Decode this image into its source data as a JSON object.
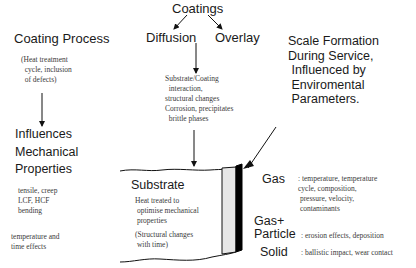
{
  "diagram": {
    "top": {
      "coatings": "Coatings",
      "diffusion": "Diffusion",
      "overlay": "Overlay"
    },
    "left": {
      "coating_process": "Coating Process",
      "coating_process_note": "(Heat treatment\n  cycle, inclusion\n  of defects)",
      "influences_line1": "Influences",
      "influences_line2": "Mechanical",
      "influences_line3": "Properties",
      "mech_note": " tensile, creep\n LCF, HCF\n bending",
      "temp_note": "temperature and\ntime effects"
    },
    "center": {
      "interaction_note": "Substrate/Coating\n  interaction,\nstructural changes\nCorrosion, precipitates\n  brittle phases",
      "substrate_title": "Substrate",
      "substrate_note1": "Heat treated to\n optimise mechanical\n properties",
      "substrate_note2": "(Structural changes\n with time)"
    },
    "right": {
      "scale_title": "Scale Formation\nDuring Service,\n Influenced by\n Enviromental\n Parameters.",
      "gas_label": "Gas",
      "gas_note": ": temperature, temperature\ncycle, composition,\n pressure, velocity,\n contaminants",
      "gas_particle_label1": "Gas+",
      "gas_particle_label2": "Particle",
      "gas_particle_note": ": erosion effects, deposition",
      "solid_label": "Solid",
      "solid_note": ": ballistic impact, wear contact"
    }
  },
  "colors": {
    "line": "#111111",
    "coating_fill": "#e6e6e6",
    "scale_fill": "#000000"
  }
}
